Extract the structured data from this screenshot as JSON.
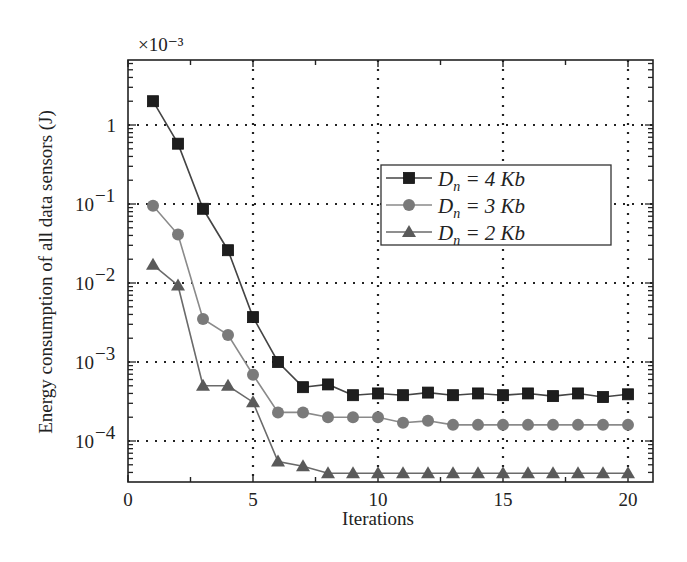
{
  "chart_data": {
    "type": "line",
    "title": "",
    "xlabel": "Iterations",
    "ylabel": "Energy consumption of all data sensors (J)",
    "y_multiplier": "×10⁻³",
    "yscale": "log",
    "xlim": [
      0,
      21
    ],
    "ylim_log10": [
      -4.52,
      0.82
    ],
    "grid": true,
    "legend_position": "upper right",
    "x_ticks": [
      0,
      5,
      10,
      15,
      20
    ],
    "x_tick_labels": [
      "0",
      "5",
      "10",
      "15",
      "20"
    ],
    "y_ticks_log10": [
      0,
      -1,
      -2,
      -3,
      -4
    ],
    "y_tick_labels": [
      "1",
      "10⁻¹",
      "10⁻²",
      "10⁻³",
      "10⁻⁴"
    ],
    "x": [
      1,
      2,
      3,
      4,
      5,
      6,
      7,
      8,
      9,
      10,
      11,
      12,
      13,
      14,
      15,
      16,
      17,
      18,
      19,
      20
    ],
    "series": [
      {
        "name": "Dn = 4 Kb",
        "label_main": "D",
        "label_sub": "n",
        "label_rest": " = 4 Kb",
        "marker": "square",
        "color": "#1e1e1e",
        "line_color": "#444444",
        "values": [
          2.0,
          0.58,
          0.087,
          0.026,
          0.0037,
          0.001,
          0.00048,
          0.00052,
          0.00038,
          0.0004,
          0.00038,
          0.00041,
          0.00038,
          0.0004,
          0.00038,
          0.0004,
          0.00037,
          0.0004,
          0.00036,
          0.00039
        ]
      },
      {
        "name": "Dn = 3 Kb",
        "label_main": "D",
        "label_sub": "n",
        "label_rest": " = 3 Kb",
        "marker": "circle",
        "color": "#7a7a7a",
        "line_color": "#8a8a8a",
        "values": [
          0.095,
          0.041,
          0.0035,
          0.0022,
          0.00069,
          0.00023,
          0.00023,
          0.0002,
          0.0002,
          0.0002,
          0.00017,
          0.00018,
          0.00016,
          0.00016,
          0.00016,
          0.00016,
          0.00016,
          0.00016,
          0.00016,
          0.00016
        ]
      },
      {
        "name": "Dn = 2 Kb",
        "label_main": "D",
        "label_sub": "n",
        "label_rest": " = 2 Kb",
        "marker": "triangle",
        "color": "#5a5a5a",
        "line_color": "#6a6a6a",
        "values": [
          0.017,
          0.0093,
          0.0005,
          0.0005,
          0.00031,
          5.5e-05,
          4.8e-05,
          3.9e-05,
          3.9e-05,
          3.9e-05,
          3.9e-05,
          3.9e-05,
          3.9e-05,
          3.9e-05,
          3.9e-05,
          3.9e-05,
          3.9e-05,
          3.9e-05,
          3.9e-05,
          3.9e-05
        ]
      }
    ]
  }
}
